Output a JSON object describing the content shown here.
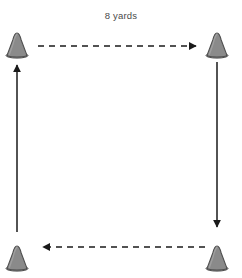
{
  "diagram": {
    "title_label": "8 yards",
    "background_color": "#ffffff",
    "width": 242,
    "height": 278,
    "cone_fill_color": "#8a8a8a",
    "cone_outline_color": "#4f4f4f",
    "arrow_color": "#1a1a1a",
    "label_color": "#4a4a4a"
  },
  "cones": [
    {
      "name": "top-left",
      "x": 17,
      "y": 45
    },
    {
      "name": "top-right",
      "x": 217,
      "y": 45
    },
    {
      "name": "bottom-left",
      "x": 17,
      "y": 258
    },
    {
      "name": "bottom-right",
      "x": 217,
      "y": 258
    }
  ],
  "arrows": [
    {
      "name": "top-arrow",
      "style": "dashed",
      "direction": "right",
      "from": {
        "x": 38,
        "y": 46
      },
      "to": {
        "x": 200,
        "y": 46
      }
    },
    {
      "name": "right-arrow",
      "style": "solid",
      "direction": "down",
      "from": {
        "x": 217,
        "y": 62
      },
      "to": {
        "x": 217,
        "y": 232
      }
    },
    {
      "name": "bottom-arrow",
      "style": "dashed",
      "direction": "left",
      "from": {
        "x": 205,
        "y": 247
      },
      "to": {
        "x": 38,
        "y": 247
      }
    },
    {
      "name": "left-arrow",
      "style": "solid",
      "direction": "up",
      "from": {
        "x": 17,
        "y": 232
      },
      "to": {
        "x": 17,
        "y": 60
      }
    }
  ]
}
